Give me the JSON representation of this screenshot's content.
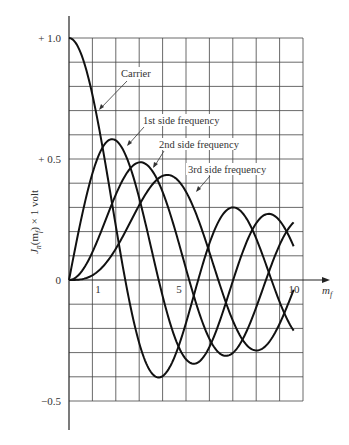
{
  "chart_data": {
    "type": "line",
    "title": "",
    "xlabel": "m_f",
    "ylabel": "J_n(m_f) × 1 volt",
    "xlim": [
      0,
      10
    ],
    "ylim": [
      -0.5,
      1.0
    ],
    "grid": true,
    "x_ticks": [
      {
        "value": 1,
        "label": "1"
      },
      {
        "value": 5,
        "label": "5"
      },
      {
        "value": 10,
        "label": "10"
      }
    ],
    "y_ticks": [
      {
        "value": 1.0,
        "label": "+ 1.0"
      },
      {
        "value": 0.5,
        "label": "+ 0.5"
      },
      {
        "value": 0,
        "label": "0"
      },
      {
        "value": -0.5,
        "label": "−0.5"
      }
    ],
    "x": [
      0,
      1,
      2,
      3,
      4,
      5,
      6,
      7,
      8,
      9,
      9.6
    ],
    "series": [
      {
        "name": "Carrier",
        "order": 0,
        "values": [
          1.0,
          0.77,
          0.22,
          -0.26,
          -0.4,
          -0.18,
          0.15,
          0.3,
          0.17,
          -0.09,
          -0.2
        ]
      },
      {
        "name": "1st side frequency",
        "order": 1,
        "values": [
          0.0,
          0.44,
          0.58,
          0.34,
          -0.07,
          -0.33,
          -0.28,
          0.0,
          0.23,
          0.25,
          0.1
        ]
      },
      {
        "name": "2nd side frequency",
        "order": 2,
        "values": [
          0.0,
          0.11,
          0.35,
          0.49,
          0.36,
          0.05,
          -0.24,
          -0.3,
          -0.11,
          0.14,
          0.23
        ]
      },
      {
        "name": "3rd side frequency",
        "order": 3,
        "values": [
          0.0,
          0.02,
          0.13,
          0.31,
          0.43,
          0.36,
          0.11,
          -0.17,
          -0.29,
          -0.18,
          -0.02
        ]
      }
    ],
    "annotations": [
      {
        "text": "Carrier",
        "series": 0
      },
      {
        "text": "1st side frequency",
        "series": 1
      },
      {
        "text": "2nd side frequency",
        "series": 2
      },
      {
        "text": "3rd side frequency",
        "series": 3
      }
    ]
  },
  "labels": {
    "y_top": "+ 1.0",
    "y_half": "+ 0.5",
    "y_zero": "0",
    "y_neg": "−0.5",
    "x_one": "1",
    "x_five": "5",
    "x_ten": "10",
    "x_axis": "m",
    "x_axis_sub": "f",
    "y_axis": "J",
    "y_axis_sub_n": "n",
    "y_axis_mid": "(m",
    "y_axis_sub_f": "f",
    "y_axis_end": ") × 1 volt",
    "carrier": "Carrier",
    "first": "1st side frequency",
    "second": "2nd side frequency",
    "third": "3rd side frequency"
  }
}
